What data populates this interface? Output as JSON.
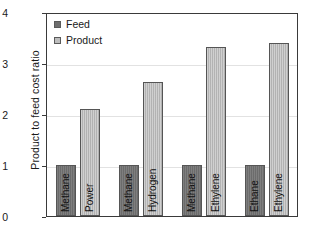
{
  "chart_data": {
    "type": "bar",
    "title": "",
    "xlabel": "",
    "ylabel": "Product to feed cost ratio",
    "ylim": [
      0,
      4
    ],
    "yticks": [
      0,
      1,
      2,
      3,
      4
    ],
    "grid": true,
    "legend_position": "top-left",
    "categories": [
      "Methane / Power",
      "Methane / Hydrogen",
      "Methane / Ethylene",
      "Ethane / Ethylene"
    ],
    "series": [
      {
        "name": "Feed",
        "color": "#707070",
        "values": [
          1.0,
          1.0,
          1.0,
          1.0
        ]
      },
      {
        "name": "Product",
        "color": "#bcbcbc",
        "values": [
          2.1,
          2.62,
          3.31,
          3.4
        ]
      }
    ],
    "bars": [
      {
        "group": 1,
        "series": "Feed",
        "label": "Methane",
        "value": 1.0
      },
      {
        "group": 1,
        "series": "Product",
        "label": "Power",
        "value": 2.1
      },
      {
        "group": 2,
        "series": "Feed",
        "label": "Methane",
        "value": 1.0
      },
      {
        "group": 2,
        "series": "Product",
        "label": "Hydrogen",
        "value": 2.62
      },
      {
        "group": 3,
        "series": "Feed",
        "label": "Methane",
        "value": 1.0
      },
      {
        "group": 3,
        "series": "Product",
        "label": "Ethylene",
        "value": 3.31
      },
      {
        "group": 4,
        "series": "Feed",
        "label": "Ethane",
        "value": 1.0
      },
      {
        "group": 4,
        "series": "Product",
        "label": "Ethylene",
        "value": 3.4
      }
    ]
  },
  "axis": {
    "ylabel": "Product to feed cost ratio",
    "ticks": [
      "4",
      "3",
      "2",
      "1",
      "0"
    ]
  },
  "legend": {
    "items": [
      {
        "label": "Feed",
        "color": "#707070"
      },
      {
        "label": "Product",
        "color": "#bcbcbc"
      }
    ]
  },
  "colors": {
    "feed": "#707070",
    "product": "#bcbcbc",
    "axis": "#3a3a3a",
    "grid": "#e2e2e2",
    "text": "#1a1a1a"
  }
}
